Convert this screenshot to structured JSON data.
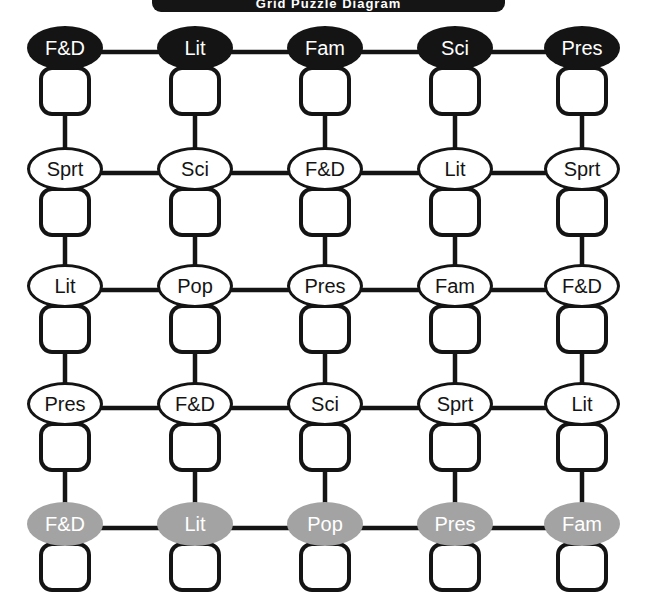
{
  "banner": {
    "title": "Grid Puzzle Diagram"
  },
  "colors": {
    "background": "#ffffff",
    "ink": "#141414",
    "dark_node_fill": "#141414",
    "dark_node_text": "#ffffff",
    "light_node_fill": "#ffffff",
    "light_node_text": "#141414",
    "grey_node_fill": "#a3a3a3",
    "grey_node_text": "#ffffff",
    "banner_fill": "#151515",
    "banner_text": "#ffffff"
  },
  "grid": {
    "columns": 5,
    "rows": 5,
    "column_x": [
      65,
      195,
      325,
      455,
      582
    ],
    "row_y": [
      52,
      173,
      290,
      408,
      528
    ],
    "rows_data": [
      {
        "index": 0,
        "style": "dark",
        "nodes": [
          {
            "label": "F&D",
            "box": ""
          },
          {
            "label": "Lit",
            "box": ""
          },
          {
            "label": "Fam",
            "box": ""
          },
          {
            "label": "Sci",
            "box": ""
          },
          {
            "label": "Pres",
            "box": ""
          }
        ]
      },
      {
        "index": 1,
        "style": "light",
        "nodes": [
          {
            "label": "Sprt",
            "box": ""
          },
          {
            "label": "Sci",
            "box": ""
          },
          {
            "label": "F&D",
            "box": ""
          },
          {
            "label": "Lit",
            "box": ""
          },
          {
            "label": "Sprt",
            "box": ""
          }
        ]
      },
      {
        "index": 2,
        "style": "light",
        "nodes": [
          {
            "label": "Lit",
            "box": ""
          },
          {
            "label": "Pop",
            "box": ""
          },
          {
            "label": "Pres",
            "box": ""
          },
          {
            "label": "Fam",
            "box": ""
          },
          {
            "label": "F&D",
            "box": ""
          }
        ]
      },
      {
        "index": 3,
        "style": "light",
        "nodes": [
          {
            "label": "Pres",
            "box": ""
          },
          {
            "label": "F&D",
            "box": ""
          },
          {
            "label": "Sci",
            "box": ""
          },
          {
            "label": "Sprt",
            "box": ""
          },
          {
            "label": "Lit",
            "box": ""
          }
        ]
      },
      {
        "index": 4,
        "style": "grey",
        "nodes": [
          {
            "label": "F&D",
            "box": ""
          },
          {
            "label": "Lit",
            "box": ""
          },
          {
            "label": "Pop",
            "box": ""
          },
          {
            "label": "Pres",
            "box": ""
          },
          {
            "label": "Fam",
            "box": ""
          }
        ]
      }
    ]
  }
}
